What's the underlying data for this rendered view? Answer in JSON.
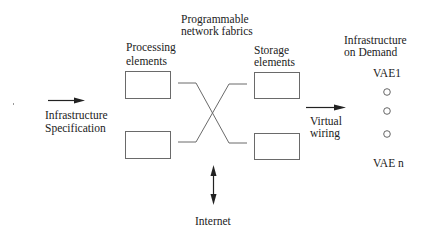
{
  "diagram": {
    "colors": {
      "stroke": "#6a6a6a",
      "text": "#222222",
      "background": "#ffffff"
    },
    "labels": {
      "fabrics": [
        "Programmable",
        "network fabrics"
      ],
      "processing": [
        "Processing",
        "elements"
      ],
      "storage": [
        "Storage",
        "elements"
      ],
      "infra_spec": [
        "Infrastructure",
        "Specification"
      ],
      "virtual_wiring": [
        "Virtual",
        "wiring"
      ],
      "infra_demand": [
        "Infrastructure",
        "on Demand"
      ],
      "vae_first": "VAE1",
      "vae_last": "VAE n",
      "internet": "Internet"
    },
    "nodes": [
      {
        "id": "processing-element-1",
        "type": "box"
      },
      {
        "id": "processing-element-2",
        "type": "box"
      },
      {
        "id": "storage-element-1",
        "type": "box"
      },
      {
        "id": "storage-element-2",
        "type": "box"
      },
      {
        "id": "vae-dot-1",
        "type": "circle"
      },
      {
        "id": "vae-dot-2",
        "type": "circle"
      },
      {
        "id": "vae-dot-3",
        "type": "circle"
      }
    ],
    "edges": [
      {
        "from": "infrastructure-specification",
        "to": "processing-elements",
        "type": "arrow"
      },
      {
        "from": "processing-element-1",
        "to": "storage-element-2",
        "type": "cross-link"
      },
      {
        "from": "processing-element-2",
        "to": "storage-element-1",
        "type": "cross-link"
      },
      {
        "from": "network-fabric",
        "to": "internet",
        "type": "bidirectional-arrow"
      },
      {
        "from": "storage-elements",
        "to": "infrastructure-on-demand",
        "type": "arrow",
        "label": "Virtual wiring"
      }
    ]
  }
}
